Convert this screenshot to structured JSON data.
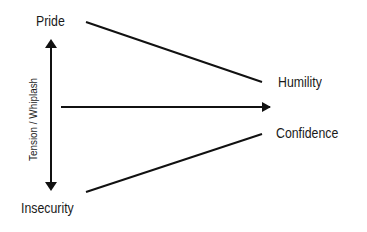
{
  "diagram": {
    "nodes": {
      "pride": "Pride",
      "humility": "Humility",
      "confidence": "Confidence",
      "insecurity": "Insecurity"
    },
    "axis_label": "Tension / Whiplash",
    "edges": [
      {
        "from": "Pride",
        "to": "Humility",
        "type": "line"
      },
      {
        "from": "Insecurity",
        "to": "Confidence",
        "type": "line"
      },
      {
        "from": "Pride",
        "to": "Insecurity",
        "type": "double-arrow",
        "label": "Tension / Whiplash"
      },
      {
        "from": "center-left",
        "to": "center-right",
        "type": "arrow"
      }
    ],
    "colors": {
      "stroke": "#111111",
      "text": "#1a1a1a",
      "background": "#ffffff"
    }
  }
}
